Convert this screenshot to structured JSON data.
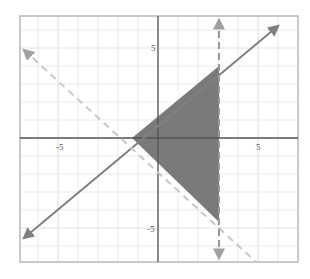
{
  "chart_data": {
    "type": "line",
    "title": "",
    "xlabel": "",
    "ylabel": "",
    "xlim": [
      -7,
      7
    ],
    "ylim": [
      -7,
      7
    ],
    "grid": true,
    "x_ticks": [
      {
        "value": -5,
        "label": "-5"
      },
      {
        "value": 5,
        "label": "5"
      }
    ],
    "y_ticks": [
      {
        "value": 5,
        "label": "5"
      },
      {
        "value": -5,
        "label": "-5"
      }
    ],
    "series": [
      {
        "name": "boundary-solid",
        "style": "solid",
        "equation": "y = x + 1",
        "points": [
          [
            -7,
            -6
          ],
          [
            6,
            7
          ]
        ]
      },
      {
        "name": "boundary-dashed-diagonal",
        "style": "dashed",
        "equation": "y = -x - 1",
        "points": [
          [
            -7,
            6
          ],
          [
            5,
            -6
          ]
        ]
      },
      {
        "name": "boundary-dashed-vertical",
        "style": "dashed",
        "equation": "x = 3",
        "points": [
          [
            3,
            7
          ],
          [
            3,
            -7
          ]
        ]
      }
    ],
    "shaded_region": {
      "vertices": [
        [
          -1,
          0
        ],
        [
          3,
          4
        ],
        [
          3,
          -4
        ]
      ],
      "color": "#7a7a7a"
    }
  },
  "colors": {
    "grid": "#e2e2e2",
    "frame": "#b8b8b8",
    "axis": "#555555",
    "line": "#808080",
    "dashed": "#a0a0a0",
    "shade": "#7a7a7a"
  }
}
